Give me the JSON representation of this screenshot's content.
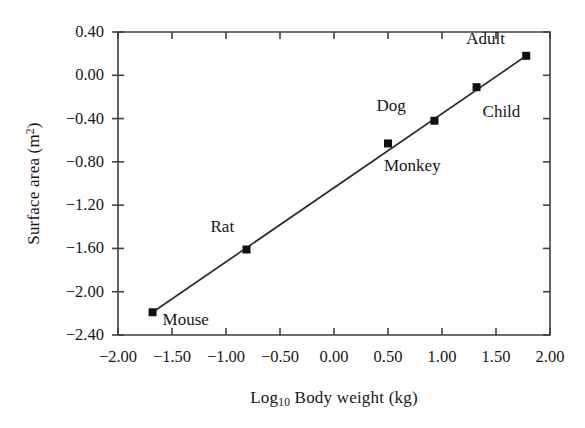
{
  "chart_data": {
    "type": "scatter",
    "title": "",
    "xlabel": "Log10 Body weight (kg)",
    "xlabel_base": "Log",
    "xlabel_sub": "10",
    "xlabel_rest": " Body weight (kg)",
    "ylabel": "Surface area (m2)",
    "ylabel_base": "Surface area (m",
    "ylabel_sup": "2",
    "ylabel_close": ")",
    "xlim": [
      -2.0,
      2.0
    ],
    "ylim": [
      -2.4,
      0.4
    ],
    "xticks": [
      "-2.00",
      "-1.50",
      "-1.00",
      "-0.50",
      "0.00",
      "0.50",
      "1.00",
      "1.50",
      "2.00"
    ],
    "xtick_values": [
      -2.0,
      -1.5,
      -1.0,
      -0.5,
      0.0,
      0.5,
      1.0,
      1.5,
      2.0
    ],
    "yticks": [
      "0.40",
      "0.00",
      "-0.40",
      "-0.80",
      "-1.20",
      "-1.60",
      "-2.00",
      "-2.40"
    ],
    "ytick_values": [
      0.4,
      0.0,
      -0.4,
      -0.8,
      -1.2,
      -1.6,
      -2.0,
      -2.4
    ],
    "grid": false,
    "legend": "none",
    "marker": "square",
    "marker_color": "#101010",
    "line_color": "#2b2b2b",
    "axis_color": "#404040",
    "points": [
      {
        "label": "Mouse",
        "x": -1.68,
        "y": -2.19,
        "label_dx": 10,
        "label_dy": 9
      },
      {
        "label": "Rat",
        "x": -0.81,
        "y": -1.61,
        "label_dx": -36,
        "label_dy": -22
      },
      {
        "label": "Monkey",
        "x": 0.5,
        "y": -0.63,
        "label_dx": -4,
        "label_dy": 24
      },
      {
        "label": "Dog",
        "x": 0.93,
        "y": -0.42,
        "label_dx": -58,
        "label_dy": -14
      },
      {
        "label": "Child",
        "x": 1.32,
        "y": -0.11,
        "label_dx": 6,
        "label_dy": 26
      },
      {
        "label": "Adult",
        "x": 1.78,
        "y": 0.18,
        "label_dx": -60,
        "label_dy": -16
      }
    ],
    "fit_line": {
      "x0": -1.68,
      "y0": -2.19,
      "x1": 1.78,
      "y1": 0.18
    }
  }
}
